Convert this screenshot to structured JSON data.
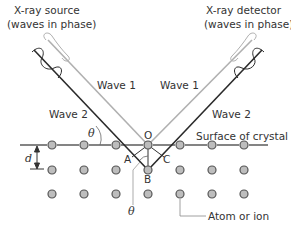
{
  "diagram": {
    "source_label_line1": "X-ray source",
    "source_label_line2": "(waves in phase)",
    "detector_label_line1": "X-ray detector",
    "detector_label_line2": "(waves in phase)",
    "wave1_left": "Wave 1",
    "wave1_right": "Wave 1",
    "wave2_left": "Wave 2",
    "wave2_right": "Wave 2",
    "surface_label": "Surface of crystal",
    "atom_label": "Atom or ion",
    "theta_upper": "θ",
    "theta_lower": "θ",
    "spacing_label": "d",
    "point_o": "O",
    "point_a": "A",
    "point_b": "B",
    "point_c": "C",
    "colors": {
      "wave1": "#b0b0b0",
      "wave2": "#2a2a2a",
      "atom_fill": "#bdbdbd",
      "atom_stroke": "#555555"
    }
  }
}
